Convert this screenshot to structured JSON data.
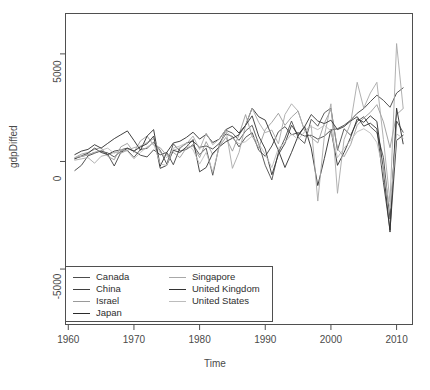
{
  "chart_data": {
    "type": "line",
    "title": "",
    "xlabel": "Time",
    "ylabel": "gdpDiffed",
    "xlim": [
      1959.5,
      2012.5
    ],
    "ylim": [
      -7600,
      6900
    ],
    "xticks": [
      1960,
      1970,
      1980,
      1990,
      2000,
      2010
    ],
    "ytick_values": [
      5000,
      0,
      -5000
    ],
    "ytick_labels": [
      "5000",
      "0",
      "-5000"
    ],
    "grid": false,
    "legend_position": "bottom-left-inside",
    "box": true,
    "x": [
      1961,
      1962,
      1963,
      1964,
      1965,
      1966,
      1967,
      1968,
      1969,
      1970,
      1971,
      1972,
      1973,
      1974,
      1975,
      1976,
      1977,
      1978,
      1979,
      1980,
      1981,
      1982,
      1983,
      1984,
      1985,
      1986,
      1987,
      1988,
      1989,
      1990,
      1991,
      1992,
      1993,
      1994,
      1995,
      1996,
      1997,
      1998,
      1999,
      2000,
      2001,
      2002,
      2003,
      2004,
      2005,
      2006,
      2007,
      2008,
      2009,
      2010,
      2011
    ],
    "series": [
      {
        "name": "Canada",
        "color": "#4c4c4c",
        "values": [
          150,
          230,
          310,
          420,
          470,
          400,
          210,
          480,
          520,
          190,
          560,
          610,
          900,
          520,
          -120,
          820,
          480,
          560,
          780,
          320,
          620,
          -640,
          760,
          1450,
          1320,
          980,
          1420,
          1680,
          820,
          -180,
          -860,
          420,
          1080,
          1880,
          1120,
          840,
          1960,
          1640,
          2260,
          2480,
          520,
          1520,
          1220,
          1860,
          2080,
          1620,
          1340,
          180,
          -2680,
          1880,
          1360
        ]
      },
      {
        "name": "China",
        "color": "#3f3f3f",
        "values": [
          -420,
          -180,
          260,
          380,
          520,
          330,
          -210,
          420,
          610,
          480,
          290,
          210,
          540,
          310,
          420,
          -150,
          620,
          860,
          940,
          660,
          720,
          580,
          840,
          1280,
          1160,
          680,
          1120,
          1340,
          520,
          240,
          720,
          1380,
          1620,
          1240,
          1340,
          1180,
          1220,
          1040,
          1180,
          1460,
          1520,
          1680,
          1920,
          2240,
          2460,
          2780,
          3080,
          2840,
          2520,
          3180,
          3420
        ]
      },
      {
        "name": "Israel",
        "color": "#9a9a9a",
        "values": [
          180,
          340,
          420,
          560,
          640,
          240,
          80,
          680,
          840,
          420,
          960,
          1180,
          760,
          640,
          280,
          420,
          180,
          640,
          720,
          180,
          920,
          320,
          680,
          1120,
          480,
          1240,
          2180,
          1180,
          620,
          1480,
          1820,
          2240,
          1680,
          2060,
          2340,
          1420,
          1120,
          860,
          1780,
          2420,
          580,
          220,
          780,
          1680,
          2020,
          2280,
          2640,
          1840,
          640,
          2180,
          2460
        ]
      },
      {
        "name": "Japan",
        "color": "#2b2b2b",
        "values": [
          320,
          480,
          560,
          780,
          620,
          840,
          1060,
          1240,
          1420,
          980,
          520,
          1180,
          1480,
          -220,
          420,
          860,
          940,
          1120,
          1360,
          1040,
          1260,
          880,
          1040,
          1480,
          1640,
          1320,
          1680,
          2480,
          2080,
          1920,
          1180,
          520,
          -280,
          420,
          1180,
          1620,
          620,
          -1120,
          140,
          1480,
          -180,
          420,
          1120,
          1980,
          1820,
          2120,
          1860,
          -420,
          -3280,
          2480,
          820
        ]
      },
      {
        "name": "Singapore",
        "color": "#a8a8a8",
        "values": [
          60,
          120,
          180,
          -80,
          240,
          320,
          420,
          380,
          520,
          640,
          720,
          880,
          1060,
          420,
          180,
          520,
          640,
          820,
          1180,
          560,
          1320,
          780,
          1040,
          1480,
          -320,
          420,
          1680,
          2480,
          1820,
          1340,
          1460,
          820,
          2180,
          2680,
          2340,
          1420,
          1680,
          -1840,
          1180,
          2680,
          -1480,
          1020,
          1780,
          3680,
          2480,
          3180,
          3680,
          1020,
          -1880,
          5480,
          2480
        ]
      },
      {
        "name": "United Kingdom",
        "color": "#333333",
        "values": [
          120,
          260,
          380,
          620,
          420,
          320,
          480,
          540,
          620,
          480,
          680,
          820,
          1180,
          -320,
          -180,
          520,
          420,
          680,
          1020,
          -480,
          -280,
          380,
          680,
          920,
          1080,
          1240,
          1680,
          2120,
          1180,
          580,
          -620,
          320,
          840,
          1680,
          1240,
          1620,
          2180,
          1880,
          1760,
          1920,
          1480,
          1620,
          1880,
          2080,
          1640,
          1780,
          1520,
          -980,
          -3180,
          980,
          1220
        ]
      },
      {
        "name": "United States",
        "color": "#bcbcbc",
        "values": [
          180,
          240,
          310,
          420,
          520,
          620,
          380,
          560,
          480,
          120,
          420,
          680,
          840,
          -120,
          -180,
          620,
          720,
          860,
          540,
          -120,
          420,
          -480,
          680,
          1420,
          1080,
          820,
          920,
          1180,
          840,
          320,
          -280,
          620,
          880,
          1280,
          1020,
          1380,
          1620,
          1480,
          1680,
          1420,
          180,
          620,
          980,
          1380,
          1520,
          1320,
          880,
          -420,
          -2180,
          1280,
          1080
        ]
      }
    ],
    "legend": {
      "entries_left": [
        "Canada",
        "China",
        "Israel",
        "Japan"
      ],
      "entries_right": [
        "Singapore",
        "United Kingdom",
        "United States"
      ]
    }
  },
  "axes": {
    "x_title": "Time",
    "y_title": "gdpDiffed",
    "x_tick_labels": [
      "1960",
      "1970",
      "1980",
      "1990",
      "2000",
      "2010"
    ],
    "y_tick_labels": [
      "5000",
      "0",
      "-5000"
    ]
  },
  "legend": {
    "items": [
      {
        "label": "Canada",
        "color": "#4c4c4c"
      },
      {
        "label": "China",
        "color": "#3f3f3f"
      },
      {
        "label": "Israel",
        "color": "#9a9a9a"
      },
      {
        "label": "Japan",
        "color": "#2b2b2b"
      },
      {
        "label": "Singapore",
        "color": "#a8a8a8"
      },
      {
        "label": "United Kingdom",
        "color": "#333333"
      },
      {
        "label": "United States",
        "color": "#bcbcbc"
      }
    ]
  }
}
